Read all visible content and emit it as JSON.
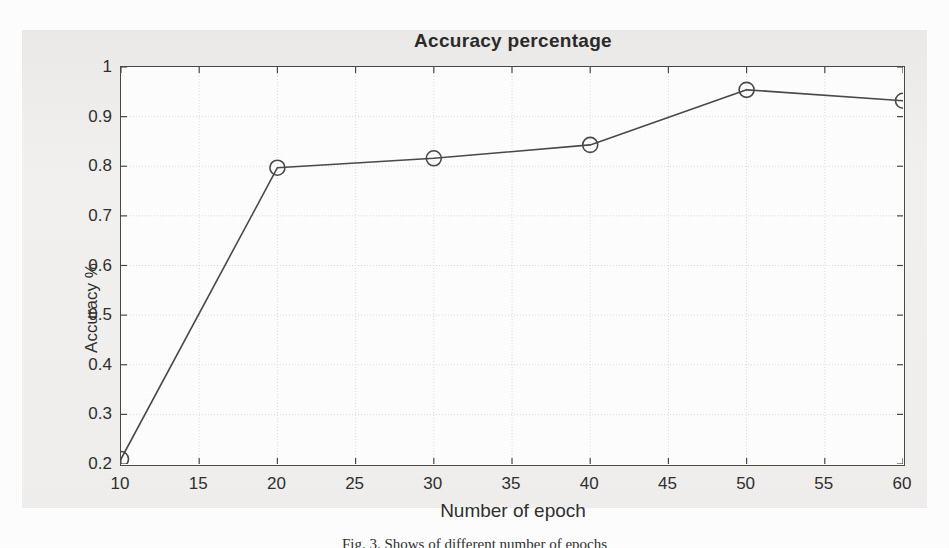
{
  "figure": {
    "caption": "Fig. 3.  Shows of different number of epochs",
    "background_color": "#f0efed"
  },
  "chart_data": {
    "type": "line",
    "title": "Accuracy percentage",
    "xlabel": "Number of epoch",
    "ylabel": "Accuracy %",
    "x": [
      10,
      20,
      30,
      40,
      50,
      60
    ],
    "values": [
      0.21,
      0.797,
      0.816,
      0.843,
      0.954,
      0.932
    ],
    "series": [
      {
        "name": "Accuracy",
        "x": [
          10,
          20,
          30,
          40,
          50,
          60
        ],
        "values": [
          0.21,
          0.797,
          0.816,
          0.843,
          0.954,
          0.932
        ]
      }
    ],
    "xlim": [
      10,
      60
    ],
    "ylim": [
      0.2,
      1.0
    ],
    "xticks": [
      10,
      15,
      20,
      25,
      30,
      35,
      40,
      45,
      50,
      55,
      60
    ],
    "xtick_labels": [
      "10",
      "15",
      "20",
      "25",
      "30",
      "35",
      "40",
      "45",
      "50",
      "55",
      "60"
    ],
    "yticks": [
      0.2,
      0.3,
      0.4,
      0.5,
      0.6,
      0.7,
      0.8,
      0.9,
      1.0
    ],
    "ytick_labels": [
      "0.2",
      "0.3",
      "0.4",
      "0.5",
      "0.6",
      "0.7",
      "0.8",
      "0.9",
      "1"
    ],
    "grid": true,
    "legend": false,
    "legend_position": "none",
    "marker": "circle-open",
    "line_color": "#4a4a4a",
    "marker_color": "#4a4a4a",
    "grid_color": "#d8d8d8",
    "axis_color": "#4a4a4a",
    "plot_background": "#ffffff"
  }
}
